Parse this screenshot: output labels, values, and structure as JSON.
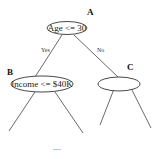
{
  "diagram": {
    "type": "decision-tree",
    "nodes": {
      "root": {
        "id": "A",
        "label": "Age <= 30"
      },
      "left": {
        "id": "B",
        "label": "Income <= $40K"
      },
      "right": {
        "id": "C",
        "label": ""
      }
    },
    "edges": {
      "root_left": {
        "label": "Yes"
      },
      "root_right": {
        "label": "No"
      }
    },
    "continuation": "...."
  }
}
